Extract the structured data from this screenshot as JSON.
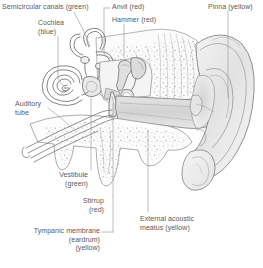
{
  "figure": {
    "width": 263,
    "height": 268,
    "background_color": "#ffffff",
    "line_color": "#6f6f6f",
    "text_color": "#5a5a5a",
    "leader_color": "#8d8d8d"
  },
  "labels": {
    "semicircular_canals": "Semicircular canals (green)",
    "cochlea_line1": "Cochlea",
    "cochlea_line2": "(blue)",
    "auditory_line1": "Auditory",
    "auditory_line2": "tube",
    "anvil": "Anvil (red)",
    "hammer": "Hammer (red)",
    "pinna": "Pinna (yellow)",
    "vestibule_line1": "Vestibule",
    "vestibule_line2": "(green)",
    "stirrup_line1": "Stirrup",
    "stirrup_line2": "(red)",
    "tympanic_line1": "Tympanic membrane",
    "tympanic_line2": "(eardrum)",
    "tympanic_line3": "(yellow)",
    "meatus_line1": "External acoustic",
    "meatus_line2": "meatus (yellow)"
  },
  "structures": [
    {
      "name": "semicircular-canals",
      "color_key": "green",
      "region": "inner-ear"
    },
    {
      "name": "cochlea",
      "color_key": "blue",
      "region": "inner-ear"
    },
    {
      "name": "vestibule",
      "color_key": "green",
      "region": "inner-ear"
    },
    {
      "name": "auditory-tube",
      "color_key": "none",
      "region": "middle-ear"
    },
    {
      "name": "anvil",
      "color_key": "red",
      "region": "middle-ear"
    },
    {
      "name": "hammer",
      "color_key": "red",
      "region": "middle-ear"
    },
    {
      "name": "stirrup",
      "color_key": "red",
      "region": "middle-ear"
    },
    {
      "name": "tympanic-membrane",
      "color_key": "yellow",
      "region": "middle-ear"
    },
    {
      "name": "external-acoustic-meatus",
      "color_key": "yellow",
      "region": "outer-ear"
    },
    {
      "name": "pinna",
      "color_key": "yellow",
      "region": "outer-ear"
    }
  ]
}
